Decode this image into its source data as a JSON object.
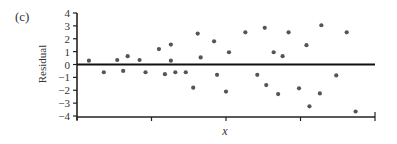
{
  "panel_label": "(c)",
  "chart_data": {
    "type": "scatter",
    "title": "",
    "xlabel": "x",
    "ylabel": "Residual",
    "ylim": [
      -4,
      4
    ],
    "yticks": [
      4,
      3,
      2,
      1,
      0,
      -1,
      -2,
      -3,
      -4
    ],
    "ytick_labels": [
      "4",
      "3",
      "2",
      "1",
      "0",
      "−1",
      "−2",
      "−3",
      "−4"
    ],
    "xticks_count": 5,
    "xtick_labels": [],
    "reference_line": 0,
    "grid": false,
    "legend": null,
    "marker_color": "#555555",
    "axis_color": "#222222",
    "points": [
      {
        "x": 0.04,
        "y": 0.3
      },
      {
        "x": 0.09,
        "y": -0.6
      },
      {
        "x": 0.135,
        "y": 0.35
      },
      {
        "x": 0.155,
        "y": -0.5
      },
      {
        "x": 0.17,
        "y": 0.65
      },
      {
        "x": 0.21,
        "y": 0.35
      },
      {
        "x": 0.23,
        "y": -0.6
      },
      {
        "x": 0.275,
        "y": 1.2
      },
      {
        "x": 0.295,
        "y": -0.75
      },
      {
        "x": 0.315,
        "y": 1.55
      },
      {
        "x": 0.315,
        "y": 0.3
      },
      {
        "x": 0.33,
        "y": -0.6
      },
      {
        "x": 0.365,
        "y": -0.6
      },
      {
        "x": 0.39,
        "y": -1.8
      },
      {
        "x": 0.405,
        "y": 2.4
      },
      {
        "x": 0.415,
        "y": 0.55
      },
      {
        "x": 0.46,
        "y": 1.8
      },
      {
        "x": 0.47,
        "y": -0.8
      },
      {
        "x": 0.5,
        "y": -2.1
      },
      {
        "x": 0.51,
        "y": 0.95
      },
      {
        "x": 0.565,
        "y": 2.5
      },
      {
        "x": 0.605,
        "y": -0.8
      },
      {
        "x": 0.63,
        "y": 2.85
      },
      {
        "x": 0.635,
        "y": -1.6
      },
      {
        "x": 0.66,
        "y": 0.95
      },
      {
        "x": 0.675,
        "y": -2.3
      },
      {
        "x": 0.69,
        "y": 0.65
      },
      {
        "x": 0.71,
        "y": 2.5
      },
      {
        "x": 0.745,
        "y": -1.85
      },
      {
        "x": 0.77,
        "y": 1.5
      },
      {
        "x": 0.78,
        "y": -3.25
      },
      {
        "x": 0.815,
        "y": -2.25
      },
      {
        "x": 0.82,
        "y": 3.05
      },
      {
        "x": 0.87,
        "y": -0.85
      },
      {
        "x": 0.905,
        "y": 2.5
      },
      {
        "x": 0.935,
        "y": -3.65
      }
    ]
  }
}
